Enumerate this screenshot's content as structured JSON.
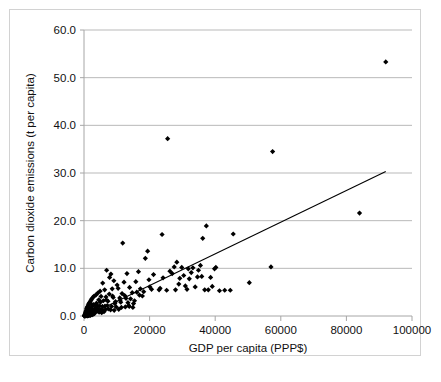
{
  "chart_data": {
    "type": "scatter",
    "title": "",
    "xlabel": "GDP per capita  (PPP$)",
    "ylabel": "Carbon dioxide emissions (t per capita)",
    "xlim": [
      0,
      100000
    ],
    "ylim": [
      0,
      60
    ],
    "xticks": [
      0,
      20000,
      40000,
      60000,
      80000,
      100000
    ],
    "xtick_labels": [
      "0",
      "20000",
      "40000",
      "60000",
      "80000",
      "100000"
    ],
    "yticks": [
      0,
      10,
      20,
      30,
      40,
      50,
      60
    ],
    "ytick_labels": [
      "0.0",
      "10.0",
      "20.0",
      "30.0",
      "40.0",
      "50.0",
      "60.0"
    ],
    "grid": "horizontal",
    "legend": "none",
    "marker": "diamond",
    "marker_color": "#000000",
    "marker_size": 4,
    "series": [
      {
        "name": "Countries",
        "points": [
          [
            92000,
            53.3
          ],
          [
            25500,
            37.2
          ],
          [
            57500,
            34.5
          ],
          [
            84000,
            21.6
          ],
          [
            37300,
            18.9
          ],
          [
            45500,
            17.2
          ],
          [
            23800,
            17.1
          ],
          [
            36200,
            16.3
          ],
          [
            11800,
            15.3
          ],
          [
            19400,
            13.6
          ],
          [
            18700,
            12.1
          ],
          [
            28300,
            11.3
          ],
          [
            57000,
            10.3
          ],
          [
            40200,
            10.2
          ],
          [
            39800,
            9.9
          ],
          [
            35500,
            10.6
          ],
          [
            33200,
            10.1
          ],
          [
            31800,
            9.9
          ],
          [
            29800,
            10.2
          ],
          [
            27500,
            10.3
          ],
          [
            6900,
            9.6
          ],
          [
            8200,
            8.8
          ],
          [
            13100,
            8.9
          ],
          [
            16600,
            9.3
          ],
          [
            21200,
            8.7
          ],
          [
            26900,
            8.9
          ],
          [
            30400,
            8.5
          ],
          [
            34600,
            8.2
          ],
          [
            35900,
            8.3
          ],
          [
            38600,
            8.1
          ],
          [
            32100,
            7.8
          ],
          [
            29200,
            7.9
          ],
          [
            24100,
            8.0
          ],
          [
            19800,
            7.6
          ],
          [
            15800,
            7.2
          ],
          [
            12200,
            7.1
          ],
          [
            9100,
            7.4
          ],
          [
            5700,
            6.9
          ],
          [
            50400,
            7.0
          ],
          [
            33900,
            6.1
          ],
          [
            30900,
            6.3
          ],
          [
            13900,
            6.0
          ],
          [
            17200,
            5.7
          ],
          [
            20600,
            5.6
          ],
          [
            22900,
            5.5
          ],
          [
            25200,
            5.4
          ],
          [
            27900,
            5.5
          ],
          [
            31400,
            5.6
          ],
          [
            36800,
            5.5
          ],
          [
            42900,
            5.4
          ],
          [
            44600,
            5.4
          ],
          [
            8600,
            5.7
          ],
          [
            10400,
            5.8
          ],
          [
            6300,
            5.5
          ],
          [
            4900,
            5.2
          ],
          [
            4200,
            4.8
          ],
          [
            7700,
            4.6
          ],
          [
            11600,
            4.7
          ],
          [
            14700,
            4.9
          ],
          [
            16100,
            5.0
          ],
          [
            18200,
            5.1
          ],
          [
            3600,
            4.4
          ],
          [
            3100,
            4.2
          ],
          [
            5200,
            4.1
          ],
          [
            6700,
            4.0
          ],
          [
            8900,
            3.9
          ],
          [
            10900,
            3.8
          ],
          [
            12800,
            3.7
          ],
          [
            14200,
            3.6
          ],
          [
            2700,
            3.9
          ],
          [
            2400,
            3.6
          ],
          [
            2100,
            3.3
          ],
          [
            4500,
            3.4
          ],
          [
            5900,
            3.2
          ],
          [
            7300,
            3.1
          ],
          [
            9600,
            3.0
          ],
          [
            11200,
            2.9
          ],
          [
            13400,
            2.8
          ],
          [
            15100,
            2.6
          ],
          [
            1900,
            3.0
          ],
          [
            1700,
            2.8
          ],
          [
            1500,
            2.6
          ],
          [
            2200,
            2.5
          ],
          [
            2900,
            2.4
          ],
          [
            3400,
            2.3
          ],
          [
            4100,
            2.2
          ],
          [
            4800,
            2.1
          ],
          [
            5600,
            2.0
          ],
          [
            6400,
            2.1
          ],
          [
            7100,
            2.2
          ],
          [
            8400,
            2.0
          ],
          [
            9800,
            1.9
          ],
          [
            11400,
            1.8
          ],
          [
            12600,
            1.9
          ],
          [
            13800,
            2.0
          ],
          [
            1300,
            2.3
          ],
          [
            1100,
            2.0
          ],
          [
            950,
            1.8
          ],
          [
            1400,
            1.6
          ],
          [
            1800,
            1.5
          ],
          [
            2300,
            1.4
          ],
          [
            2800,
            1.3
          ],
          [
            3300,
            1.5
          ],
          [
            3900,
            1.6
          ],
          [
            4400,
            1.4
          ],
          [
            5100,
            1.3
          ],
          [
            5800,
            1.2
          ],
          [
            6600,
            1.4
          ],
          [
            7400,
            1.5
          ],
          [
            8100,
            1.3
          ],
          [
            9200,
            1.2
          ],
          [
            10600,
            1.4
          ],
          [
            800,
            1.5
          ],
          [
            700,
            1.2
          ],
          [
            600,
            1.0
          ],
          [
            900,
            0.9
          ],
          [
            1200,
            0.8
          ],
          [
            1600,
            0.9
          ],
          [
            2000,
            1.0
          ],
          [
            2500,
            0.8
          ],
          [
            3000,
            0.7
          ],
          [
            3500,
            0.9
          ],
          [
            4000,
            1.0
          ],
          [
            4600,
            0.8
          ],
          [
            5400,
            0.7
          ],
          [
            6100,
            0.9
          ],
          [
            500,
            0.8
          ],
          [
            450,
            0.6
          ],
          [
            400,
            0.5
          ],
          [
            550,
            0.4
          ],
          [
            650,
            0.3
          ],
          [
            750,
            0.5
          ],
          [
            850,
            0.6
          ],
          [
            1000,
            0.4
          ],
          [
            1250,
            0.3
          ],
          [
            1550,
            0.5
          ],
          [
            1900,
            0.6
          ],
          [
            2300,
            0.4
          ],
          [
            2700,
            0.3
          ],
          [
            3200,
            0.5
          ],
          [
            350,
            0.3
          ],
          [
            300,
            0.2
          ],
          [
            260,
            0.15
          ],
          [
            420,
            0.2
          ],
          [
            520,
            0.25
          ],
          [
            620,
            0.15
          ],
          [
            720,
            0.2
          ],
          [
            880,
            0.25
          ],
          [
            1100,
            0.2
          ],
          [
            1350,
            0.15
          ],
          [
            1650,
            0.25
          ],
          [
            2050,
            0.2
          ],
          [
            2450,
            0.3
          ],
          [
            230,
            0.1
          ],
          [
            200,
            0.08
          ],
          [
            180,
            0.06
          ],
          [
            280,
            0.1
          ],
          [
            380,
            0.12
          ],
          [
            480,
            0.08
          ],
          [
            580,
            0.1
          ],
          [
            780,
            0.12
          ],
          [
            980,
            0.1
          ],
          [
            1180,
            0.08
          ],
          [
            1500,
            0.1
          ],
          [
            1850,
            0.12
          ],
          [
            160,
            0.05
          ],
          [
            140,
            0.04
          ],
          [
            120,
            0.03
          ],
          [
            210,
            0.05
          ],
          [
            310,
            0.06
          ],
          [
            410,
            0.04
          ],
          [
            510,
            0.05
          ],
          [
            710,
            0.06
          ],
          [
            910,
            0.05
          ],
          [
            1150,
            0.04
          ],
          [
            7800,
            8.1
          ],
          [
            10100,
            6.5
          ],
          [
            12400,
            4.3
          ],
          [
            15400,
            3.2
          ],
          [
            17800,
            4.2
          ],
          [
            20100,
            6.1
          ],
          [
            23200,
            5.8
          ],
          [
            26200,
            9.4
          ],
          [
            28900,
            6.7
          ],
          [
            32700,
            9.1
          ],
          [
            34900,
            9.6
          ],
          [
            37900,
            5.5
          ],
          [
            39100,
            6.2
          ],
          [
            41300,
            5.3
          ],
          [
            9400,
            2.6
          ],
          [
            11000,
            3.3
          ],
          [
            13600,
            2.2
          ],
          [
            14900,
            1.8
          ],
          [
            16900,
            4.4
          ],
          [
            5000,
            2.9
          ],
          [
            6800,
            3.4
          ],
          [
            8700,
            4.2
          ],
          [
            3800,
            2.7
          ],
          [
            2600,
            2.1
          ],
          [
            1450,
            1.1
          ],
          [
            2150,
            1.7
          ]
        ]
      }
    ],
    "trendline": {
      "type": "linear",
      "x_start": 2500,
      "y_start": 0.6,
      "x_end": 92000,
      "y_end": 30.3,
      "color": "#000000"
    }
  },
  "style": {
    "plot_background": "#ffffff",
    "frame_border_color": "#d2d2d2",
    "gridline_color": "#b9b9b9",
    "axis_line_color": "#a6a6a6",
    "text_color": "#111111"
  }
}
